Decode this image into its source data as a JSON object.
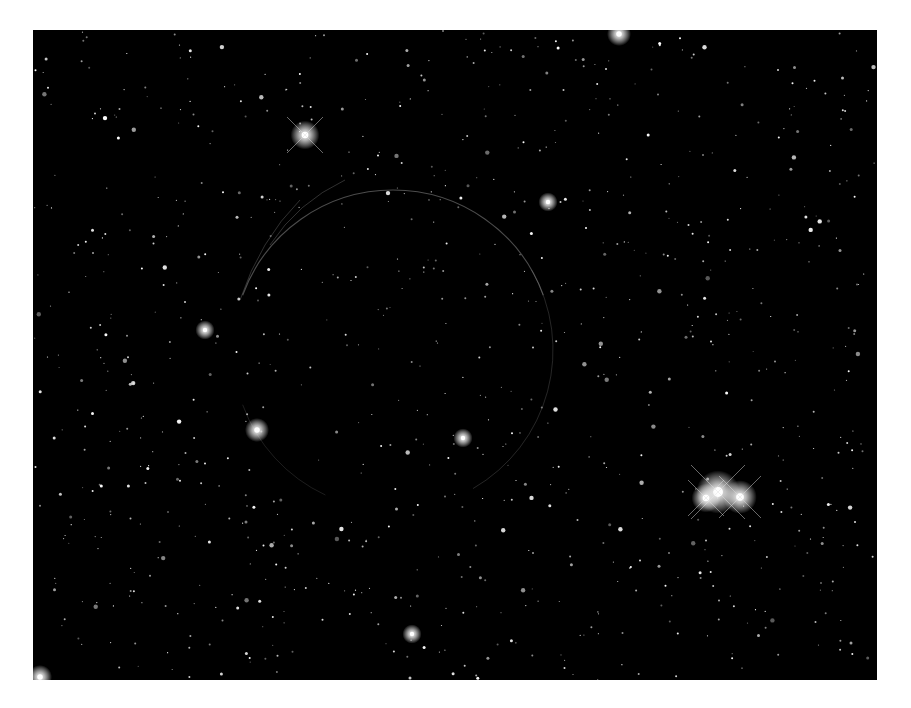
{
  "image": {
    "subject": "star field with faint circular nebula ring",
    "background_color": "#ffffff",
    "field_color": "#000000",
    "field_box": {
      "x": 33,
      "y": 30,
      "width": 844,
      "height": 650
    },
    "ring": {
      "cx": 393,
      "cy": 350,
      "r": 160,
      "color": "#8a8a8a"
    },
    "bright_stars": [
      {
        "x": 718,
        "y": 492,
        "r": 9
      },
      {
        "x": 740,
        "y": 497,
        "r": 7
      },
      {
        "x": 706,
        "y": 498,
        "r": 6
      },
      {
        "x": 305,
        "y": 135,
        "r": 6
      },
      {
        "x": 257,
        "y": 430,
        "r": 5
      },
      {
        "x": 205,
        "y": 330,
        "r": 4
      },
      {
        "x": 619,
        "y": 34,
        "r": 5
      },
      {
        "x": 463,
        "y": 438,
        "r": 4
      },
      {
        "x": 548,
        "y": 202,
        "r": 4
      },
      {
        "x": 40,
        "y": 677,
        "r": 5
      },
      {
        "x": 412,
        "y": 634,
        "r": 4
      }
    ]
  }
}
